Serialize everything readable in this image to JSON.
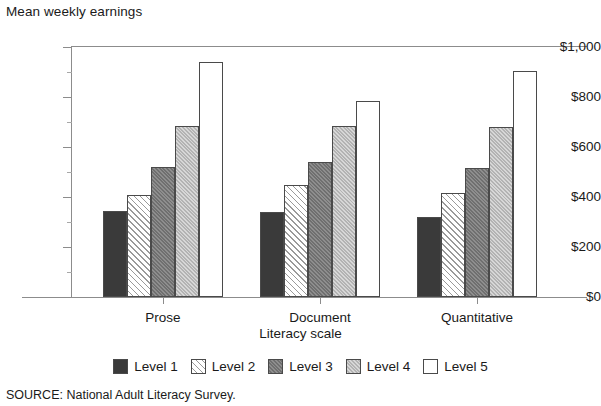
{
  "figure": {
    "y_axis_title": "Mean weekly earnings",
    "x_axis_title": "Literacy scale",
    "source_note": "SOURCE: National Adult Literacy Survey."
  },
  "chart_data": {
    "type": "bar",
    "title": "",
    "subtitle": "",
    "xlabel": "Literacy scale",
    "ylabel": "Mean weekly earnings",
    "categories": [
      "Prose",
      "Document",
      "Quantitative"
    ],
    "series": [
      {
        "name": "Level 1",
        "values": [
          345,
          340,
          320
        ],
        "fill": "solid-dark",
        "color": "#3a3a3a"
      },
      {
        "name": "Level 2",
        "values": [
          410,
          448,
          415
        ],
        "fill": "diagonal-hatch",
        "color": "#ffffff"
      },
      {
        "name": "Level 3",
        "values": [
          520,
          540,
          515
        ],
        "fill": "medium-gray",
        "color": "#7c7c7c"
      },
      {
        "name": "Level 4",
        "values": [
          685,
          685,
          680
        ],
        "fill": "light-gray",
        "color": "#c2c2c2"
      },
      {
        "name": "Level 5",
        "values": [
          940,
          785,
          905
        ],
        "fill": "white",
        "color": "#ffffff"
      }
    ],
    "ylim": [
      0,
      1000
    ],
    "y_major_ticks": [
      0,
      200,
      400,
      600,
      800,
      1000
    ],
    "y_minor_ticks": [
      100,
      300,
      500,
      700,
      900
    ],
    "y_tick_labels": [
      "$0",
      "$200",
      "$400",
      "$600",
      "$800",
      "$1,000"
    ],
    "grid": false,
    "legend_position": "bottom",
    "legend_entries": [
      "Level 1",
      "Level 2",
      "Level 3",
      "Level 4",
      "Level 5"
    ]
  }
}
